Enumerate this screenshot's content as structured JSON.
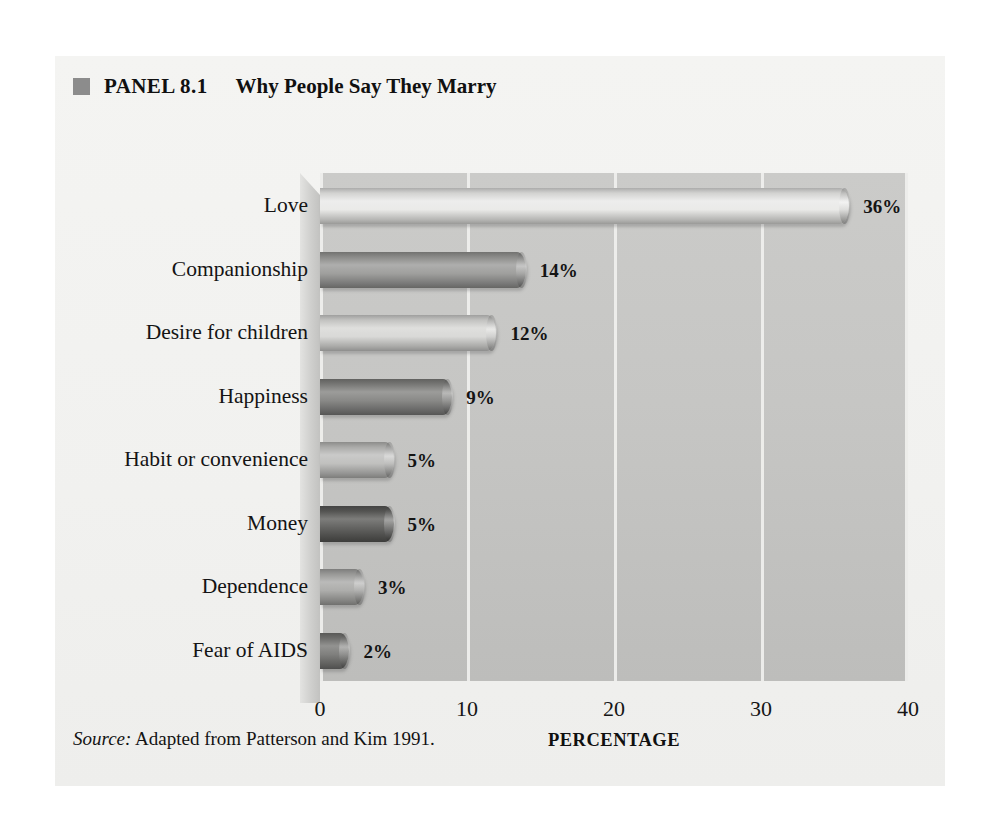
{
  "panel": {
    "marker_color": "#8c8c8c",
    "label": "PANEL 8.1",
    "title": "Why People Say They Marry",
    "source_prefix": "Source:",
    "source_text": "Adapted from Patterson and Kim 1991."
  },
  "chart_data": {
    "type": "bar",
    "orientation": "horizontal",
    "title": "Why People Say They Marry",
    "xlabel": "PERCENTAGE",
    "ylabel": "",
    "xlim": [
      0,
      40
    ],
    "xticks": [
      0,
      10,
      20,
      30,
      40
    ],
    "xtick_labels": [
      "0",
      "10",
      "20",
      "30",
      "40"
    ],
    "grid": true,
    "grid_axis": "x",
    "legend": "none",
    "categories": [
      "Love",
      "Companionship",
      "Desire for children",
      "Happiness",
      "Habit or convenience",
      "Money",
      "Dependence",
      "Fear of AIDS"
    ],
    "values": [
      36,
      14,
      12,
      9,
      5,
      5,
      3,
      2
    ],
    "value_labels": [
      "36%",
      "14%",
      "12%",
      "9%",
      "5%",
      "5%",
      "3%",
      "2%"
    ],
    "bar_colors": [
      "#e9e9e7",
      "#9a9a98",
      "#d7d7d5",
      "#838381",
      "#bdbdbb",
      "#5c5c5a",
      "#a9a9a7",
      "#787876"
    ],
    "plot_background": "#c6c6c4",
    "gridline_color": "#f0f0ee"
  }
}
